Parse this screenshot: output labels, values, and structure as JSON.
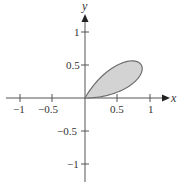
{
  "chart_data": {
    "type": "line",
    "title": "",
    "xlabel": "x",
    "ylabel": "y",
    "xlim": [
      -1.1,
      1.2
    ],
    "ylim": [
      -1.2,
      1.25
    ],
    "grid": false,
    "x_ticks": [
      -1,
      -0.5,
      0.5,
      1
    ],
    "x_tick_labels": [
      "−1",
      "−0.5",
      "0.5",
      "1"
    ],
    "y_ticks": [
      1,
      0.5,
      -0.5,
      -1
    ],
    "y_tick_labels": [
      "1",
      "0.5",
      "−0.5",
      "−1"
    ],
    "series": [
      {
        "name": "petal",
        "equation": "r = sin(3θ)",
        "theta_range": [
          0,
          1.0472
        ],
        "fill": "#d3d3d3",
        "stroke": "#6e6e6e",
        "tip": [
          0.866,
          0.5
        ]
      }
    ]
  },
  "labels": {
    "x_axis": "x",
    "y_axis": "y",
    "xt": [
      "−1",
      "−0.5",
      "0.5",
      "1"
    ],
    "yt": [
      "1",
      "0.5",
      "−0.5",
      "−1"
    ]
  },
  "colors": {
    "axis": "#555555",
    "fill": "#d3d3d3",
    "stroke": "#6e6e6e"
  }
}
